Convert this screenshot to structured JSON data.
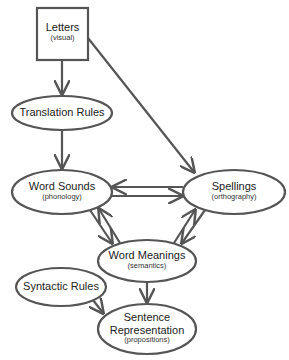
{
  "diagram": {
    "nodes": [
      {
        "id": "letters",
        "title": "Letters",
        "subtitle": "(visual)",
        "shape": "box"
      },
      {
        "id": "translation",
        "title": "Translation Rules",
        "subtitle": "",
        "shape": "ellipse"
      },
      {
        "id": "word_sounds",
        "title": "Word Sounds",
        "subtitle": "(phonology)",
        "shape": "ellipse"
      },
      {
        "id": "spellings",
        "title": "Spellings",
        "subtitle": "(orthography)",
        "shape": "ellipse"
      },
      {
        "id": "word_meanings",
        "title": "Word Meanings",
        "subtitle": "(semantics)",
        "shape": "ellipse"
      },
      {
        "id": "syntactic",
        "title": "Syntactic Rules",
        "subtitle": "",
        "shape": "ellipse"
      },
      {
        "id": "sentence",
        "title": "Sentence",
        "title2": "Representation",
        "subtitle": "(propositions)",
        "shape": "ellipse"
      }
    ],
    "edges": [
      {
        "from": "letters",
        "to": "translation"
      },
      {
        "from": "letters",
        "to": "spellings"
      },
      {
        "from": "translation",
        "to": "word_sounds"
      },
      {
        "from": "word_sounds",
        "to": "spellings"
      },
      {
        "from": "spellings",
        "to": "word_sounds"
      },
      {
        "from": "word_sounds",
        "to": "word_meanings"
      },
      {
        "from": "word_meanings",
        "to": "word_sounds"
      },
      {
        "from": "spellings",
        "to": "word_meanings"
      },
      {
        "from": "word_meanings",
        "to": "spellings"
      },
      {
        "from": "word_meanings",
        "to": "sentence"
      },
      {
        "from": "syntactic",
        "to": "sentence"
      }
    ],
    "colors": {
      "stroke": "#555555",
      "text": "#222222",
      "background": "#ffffff"
    }
  }
}
